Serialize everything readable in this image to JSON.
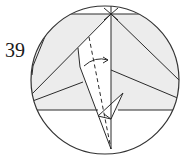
{
  "step": {
    "number": "39"
  },
  "diagram": {
    "type": "origami-fold-step",
    "instruction_symbols": [
      "valley-fold-dashed-line",
      "fold-direction-arrow"
    ],
    "colors": {
      "paper_shaded": "#ececec",
      "paper_white": "#ffffff",
      "line": "#2a2a2a",
      "circle": "#333333"
    }
  }
}
